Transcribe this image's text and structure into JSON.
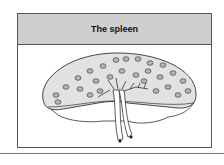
{
  "figure": {
    "title": "The spleen",
    "colors": {
      "header_bg": "#cfcfcf",
      "organ_fill": "#e2e2e2",
      "nodule_fill": "#b5b5b5",
      "stroke": "#333333"
    }
  }
}
